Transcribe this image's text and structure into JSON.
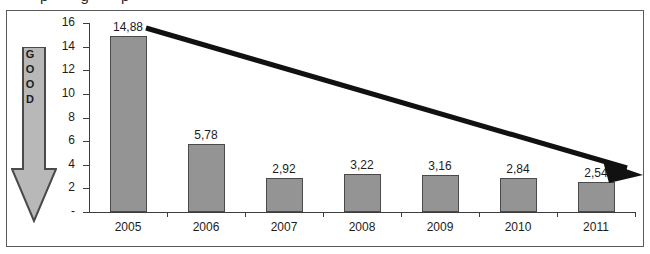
{
  "page": {
    "cutoff_text_fragment": "p    g    p"
  },
  "annotation": {
    "direction_arrow_label": "GOOD",
    "direction_arrow_letters": [
      "G",
      "O",
      "O",
      "D"
    ],
    "trend_arrow_name": "declining-trend-arrow"
  },
  "colors": {
    "bar_fill": "#949494",
    "bar_border": "#4a4a4a",
    "axis": "#3d3d3d",
    "frame_border": "#5a5a5a",
    "arrow_fill": "#b8b8b8",
    "arrow_border": "#4a4a4a",
    "trend_arrow": "#111111",
    "text": "#1c1c1c",
    "background": "#ffffff"
  },
  "chart_data": {
    "type": "bar",
    "title": "",
    "subtitle": "",
    "xlabel": "",
    "ylabel": "",
    "categories": [
      "2005",
      "2006",
      "2007",
      "2008",
      "2009",
      "2010",
      "2011"
    ],
    "values": [
      14.88,
      5.78,
      2.92,
      3.22,
      3.16,
      2.84,
      2.54
    ],
    "data_labels": [
      "14,88",
      "5,78",
      "2,92",
      "3,22",
      "3,16",
      "2,84",
      "2,54"
    ],
    "decimal_separator": ",",
    "ylim": [
      0,
      16
    ],
    "yticks": [
      0,
      2,
      4,
      6,
      8,
      10,
      12,
      14,
      16
    ],
    "ytick_labels": [
      "-",
      "2",
      "4",
      "6",
      "8",
      "10",
      "12",
      "14",
      "16"
    ],
    "grid": false,
    "legend": null,
    "annotations": [
      {
        "type": "arrow",
        "label": "GOOD",
        "orientation": "vertical-down",
        "meaning": "lower-is-better"
      },
      {
        "type": "arrow",
        "label": "",
        "orientation": "diagonal-down-right",
        "meaning": "declining-trend"
      }
    ]
  }
}
